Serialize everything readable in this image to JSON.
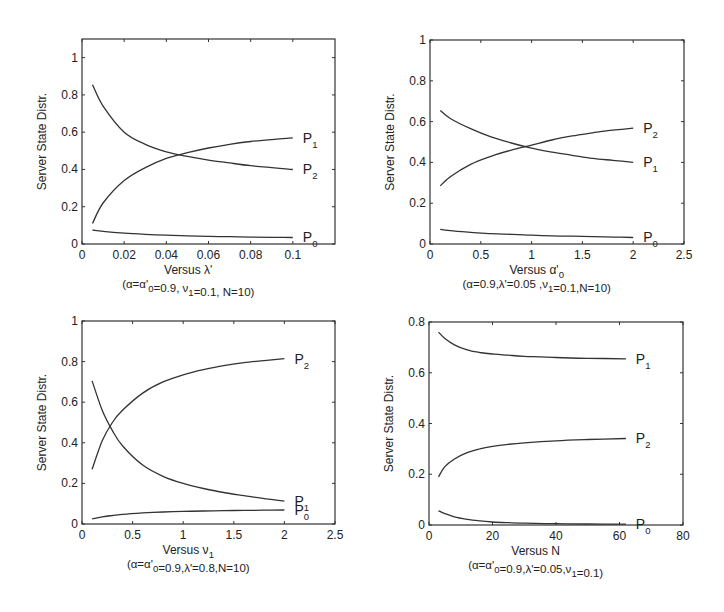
{
  "chart_data": [
    {
      "type": "line",
      "panel": "top-left",
      "xlabel": "Versus λ'",
      "caption": "(α=α'0=0.9, ν1=0.1, N=10)",
      "ylabel": "Server State Distr.",
      "xlim": [
        0,
        0.12
      ],
      "ylim": [
        0,
        1.1
      ],
      "xticks": [
        0,
        0.02,
        0.04,
        0.06,
        0.08,
        0.1
      ],
      "xtick_labels": [
        "0",
        "0.02",
        "0.04",
        "0.06",
        "0.08",
        "0.1"
      ],
      "yticks": [
        0,
        0.2,
        0.4,
        0.6,
        0.8,
        1
      ],
      "ytick_labels": [
        "0",
        "0.2",
        "0.4",
        "0.6",
        "0.8",
        "1"
      ],
      "grid": false,
      "x": [
        0.005,
        0.01,
        0.02,
        0.03,
        0.04,
        0.05,
        0.06,
        0.07,
        0.08,
        0.09,
        0.1
      ],
      "series": [
        {
          "name": "P1",
          "label": "P",
          "sub": "1",
          "values": [
            0.11,
            0.22,
            0.34,
            0.41,
            0.46,
            0.49,
            0.515,
            0.535,
            0.55,
            0.56,
            0.57
          ]
        },
        {
          "name": "P2",
          "label": "P",
          "sub": "2",
          "values": [
            0.855,
            0.74,
            0.6,
            0.535,
            0.495,
            0.47,
            0.45,
            0.435,
            0.42,
            0.41,
            0.4
          ]
        },
        {
          "name": "P0",
          "label": "P",
          "sub": "0",
          "values": [
            0.075,
            0.068,
            0.058,
            0.052,
            0.047,
            0.044,
            0.041,
            0.039,
            0.037,
            0.036,
            0.035
          ]
        }
      ]
    },
    {
      "type": "line",
      "panel": "top-right",
      "xlabel": "Versus α'0",
      "caption": "(α=0.9,λ'=0.05 ,ν1=0.1,N=10)",
      "ylabel": "Server State Distr.",
      "xlim": [
        0,
        2.5
      ],
      "ylim": [
        0,
        1
      ],
      "xticks": [
        0,
        0.5,
        1,
        1.5,
        2,
        2.5
      ],
      "xtick_labels": [
        "0",
        "0.5",
        "1",
        "1.5",
        "2",
        "2.5"
      ],
      "yticks": [
        0,
        0.2,
        0.4,
        0.6,
        0.8,
        1
      ],
      "ytick_labels": [
        "0",
        "0.2",
        "0.4",
        "0.6",
        "0.8",
        "1"
      ],
      "grid": false,
      "x": [
        0.1,
        0.2,
        0.4,
        0.6,
        0.8,
        1.0,
        1.2,
        1.4,
        1.6,
        1.8,
        2.0
      ],
      "series": [
        {
          "name": "P2",
          "label": "P",
          "sub": "2",
          "values": [
            0.285,
            0.33,
            0.39,
            0.43,
            0.46,
            0.485,
            0.51,
            0.53,
            0.545,
            0.558,
            0.568
          ]
        },
        {
          "name": "P1",
          "label": "P",
          "sub": "1",
          "values": [
            0.655,
            0.615,
            0.565,
            0.525,
            0.495,
            0.47,
            0.45,
            0.435,
            0.42,
            0.41,
            0.4
          ]
        },
        {
          "name": "P0",
          "label": "P",
          "sub": "0",
          "values": [
            0.072,
            0.065,
            0.057,
            0.051,
            0.047,
            0.043,
            0.04,
            0.038,
            0.036,
            0.034,
            0.032
          ]
        }
      ]
    },
    {
      "type": "line",
      "panel": "bottom-left",
      "xlabel": "Versus ν1",
      "caption": "(α=α'0=0.9,λ'=0.8,N=10)",
      "ylabel": "Server State Distr.",
      "xlim": [
        0,
        2.5
      ],
      "ylim": [
        0,
        1
      ],
      "xticks": [
        0,
        0.5,
        1,
        1.5,
        2,
        2.5
      ],
      "xtick_labels": [
        "0",
        "0.5",
        "1",
        "1.5",
        "2",
        "2.5"
      ],
      "yticks": [
        0,
        0.2,
        0.4,
        0.6,
        0.8,
        1
      ],
      "ytick_labels": [
        "0",
        "0.2",
        "0.4",
        "0.6",
        "0.8",
        "1"
      ],
      "grid": false,
      "x": [
        0.1,
        0.2,
        0.3,
        0.4,
        0.6,
        0.8,
        1.0,
        1.2,
        1.4,
        1.6,
        1.8,
        2.0
      ],
      "series": [
        {
          "name": "P2",
          "label": "P",
          "sub": "2",
          "values": [
            0.27,
            0.41,
            0.5,
            0.56,
            0.645,
            0.7,
            0.735,
            0.76,
            0.78,
            0.795,
            0.805,
            0.815
          ]
        },
        {
          "name": "P1",
          "label": "P",
          "sub": "1",
          "values": [
            0.705,
            0.56,
            0.46,
            0.385,
            0.29,
            0.235,
            0.2,
            0.175,
            0.155,
            0.14,
            0.125,
            0.113
          ]
        },
        {
          "name": "P0",
          "label": "P",
          "sub": "0",
          "values": [
            0.025,
            0.035,
            0.042,
            0.048,
            0.055,
            0.059,
            0.062,
            0.064,
            0.066,
            0.067,
            0.068,
            0.069
          ]
        }
      ]
    },
    {
      "type": "line",
      "panel": "bottom-right",
      "xlabel": "Versus N",
      "caption": "(α=α'0=0.9,λ'=0.05,ν1=0.1)",
      "ylabel": "Server State Distr.",
      "xlim": [
        0,
        80
      ],
      "ylim": [
        0,
        0.8
      ],
      "xticks": [
        0,
        20,
        40,
        60,
        80
      ],
      "xtick_labels": [
        "0",
        "20",
        "40",
        "60",
        "80"
      ],
      "yticks": [
        0,
        0.2,
        0.4,
        0.6,
        0.8
      ],
      "ytick_labels": [
        "0",
        "0.2",
        "0.4",
        "0.6",
        "0.8"
      ],
      "grid": false,
      "x": [
        3,
        5,
        8,
        12,
        16,
        20,
        25,
        30,
        40,
        50,
        62
      ],
      "series": [
        {
          "name": "P1",
          "label": "P",
          "sub": "1",
          "values": [
            0.76,
            0.735,
            0.71,
            0.69,
            0.68,
            0.674,
            0.669,
            0.665,
            0.66,
            0.657,
            0.655
          ]
        },
        {
          "name": "P2",
          "label": "P",
          "sub": "2",
          "values": [
            0.19,
            0.23,
            0.26,
            0.285,
            0.3,
            0.31,
            0.318,
            0.324,
            0.332,
            0.337,
            0.341
          ]
        },
        {
          "name": "P0",
          "label": "P",
          "sub": "0",
          "values": [
            0.056,
            0.045,
            0.032,
            0.022,
            0.016,
            0.012,
            0.009,
            0.007,
            0.005,
            0.004,
            0.003
          ]
        }
      ]
    }
  ],
  "layout": {
    "panels": [
      {
        "left": 82,
        "top": 39,
        "right": 335,
        "bottom": 244
      },
      {
        "left": 430,
        "top": 40,
        "right": 684,
        "bottom": 244
      },
      {
        "left": 82,
        "top": 321,
        "right": 335,
        "bottom": 524
      },
      {
        "left": 429,
        "top": 322,
        "right": 683,
        "bottom": 525
      }
    ]
  }
}
